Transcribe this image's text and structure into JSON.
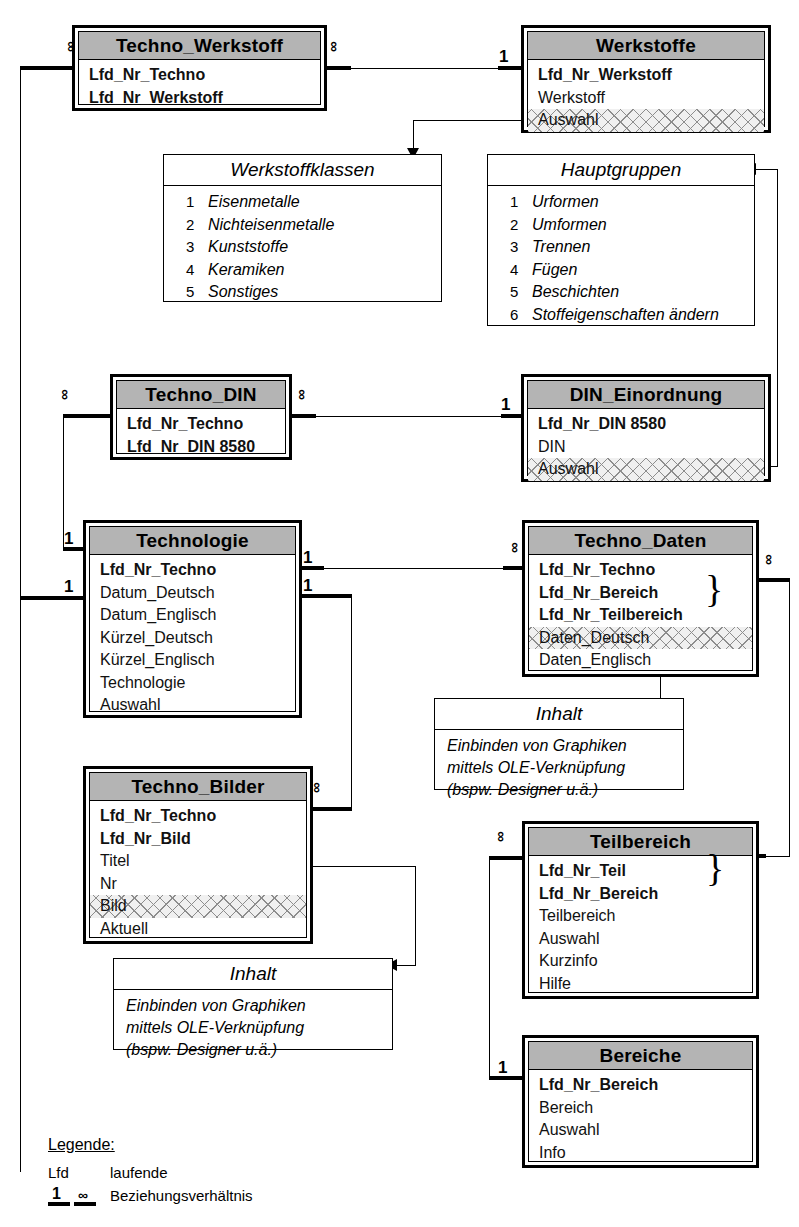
{
  "diagram": {
    "entities": [
      {
        "id": "techno_werkstoff",
        "name": "Techno_Werkstoff",
        "fields": [
          {
            "label": "Lfd_Nr_Techno",
            "key": true,
            "hatched": false
          },
          {
            "label": "Lfd_Nr_Werkstoff",
            "key": true,
            "hatched": false
          }
        ]
      },
      {
        "id": "werkstoffe",
        "name": "Werkstoffe",
        "fields": [
          {
            "label": "Lfd_Nr_Werkstoff",
            "key": true,
            "hatched": false
          },
          {
            "label": "Werkstoff",
            "key": false,
            "hatched": false
          },
          {
            "label": "Auswahl",
            "key": false,
            "hatched": true
          }
        ]
      },
      {
        "id": "techno_din",
        "name": "Techno_DIN",
        "fields": [
          {
            "label": "Lfd_Nr_Techno",
            "key": true,
            "hatched": false
          },
          {
            "label": "Lfd_Nr_DIN 8580",
            "key": true,
            "hatched": false
          }
        ]
      },
      {
        "id": "din_einordnung",
        "name": "DIN_Einordnung",
        "fields": [
          {
            "label": "Lfd_Nr_DIN 8580",
            "key": true,
            "hatched": false
          },
          {
            "label": "DIN",
            "key": false,
            "hatched": false
          },
          {
            "label": "Auswahl",
            "key": false,
            "hatched": true
          }
        ]
      },
      {
        "id": "technologie",
        "name": "Technologie",
        "fields": [
          {
            "label": "Lfd_Nr_Techno",
            "key": true,
            "hatched": false
          },
          {
            "label": "Datum_Deutsch",
            "key": false,
            "hatched": false
          },
          {
            "label": "Datum_Englisch",
            "key": false,
            "hatched": false
          },
          {
            "label": "Kürzel_Deutsch",
            "key": false,
            "hatched": false
          },
          {
            "label": "Kürzel_Englisch",
            "key": false,
            "hatched": false
          },
          {
            "label": "Technologie",
            "key": false,
            "hatched": false
          },
          {
            "label": "Auswahl",
            "key": false,
            "hatched": false
          }
        ]
      },
      {
        "id": "techno_daten",
        "name": "Techno_Daten",
        "fields": [
          {
            "label": "Lfd_Nr_Techno",
            "key": true,
            "hatched": false
          },
          {
            "label": "Lfd_Nr_Bereich",
            "key": true,
            "hatched": false
          },
          {
            "label": "Lfd_Nr_Teilbereich",
            "key": true,
            "hatched": false
          },
          {
            "label": "Daten_Deutsch",
            "key": false,
            "hatched": true
          },
          {
            "label": "Daten_Englisch",
            "key": false,
            "hatched": false
          }
        ]
      },
      {
        "id": "techno_bilder",
        "name": "Techno_Bilder",
        "fields": [
          {
            "label": "Lfd_Nr_Techno",
            "key": true,
            "hatched": false
          },
          {
            "label": "Lfd_Nr_Bild",
            "key": true,
            "hatched": false
          },
          {
            "label": "Titel",
            "key": false,
            "hatched": false
          },
          {
            "label": "Nr",
            "key": false,
            "hatched": false
          },
          {
            "label": "Bild",
            "key": false,
            "hatched": true
          },
          {
            "label": "Aktuell",
            "key": false,
            "hatched": false
          }
        ]
      },
      {
        "id": "teilbereich",
        "name": "Teilbereich",
        "fields": [
          {
            "label": "Lfd_Nr_Teil",
            "key": true,
            "hatched": false
          },
          {
            "label": "Lfd_Nr_Bereich",
            "key": true,
            "hatched": false
          },
          {
            "label": "Teilbereich",
            "key": false,
            "hatched": false
          },
          {
            "label": "Auswahl",
            "key": false,
            "hatched": false
          },
          {
            "label": "Kurzinfo",
            "key": false,
            "hatched": false
          },
          {
            "label": "Hilfe",
            "key": false,
            "hatched": false
          }
        ]
      },
      {
        "id": "bereiche",
        "name": "Bereiche",
        "fields": [
          {
            "label": "Lfd_Nr_Bereich",
            "key": true,
            "hatched": false
          },
          {
            "label": "Bereich",
            "key": false,
            "hatched": false
          },
          {
            "label": "Auswahl",
            "key": false,
            "hatched": false
          },
          {
            "label": "Info",
            "key": false,
            "hatched": false
          }
        ]
      }
    ],
    "lookups": [
      {
        "id": "werkstoffklassen",
        "name": "Werkstoffklassen",
        "rows": [
          {
            "num": "1",
            "label": "Eisenmetalle"
          },
          {
            "num": "2",
            "label": "Nichteisenmetalle"
          },
          {
            "num": "3",
            "label": "Kunststoffe"
          },
          {
            "num": "4",
            "label": "Keramiken"
          },
          {
            "num": "5",
            "label": "Sonstiges"
          }
        ]
      },
      {
        "id": "hauptgruppen",
        "name": "Hauptgruppen",
        "rows": [
          {
            "num": "1",
            "label": "Urformen"
          },
          {
            "num": "2",
            "label": "Umformen"
          },
          {
            "num": "3",
            "label": "Trennen"
          },
          {
            "num": "4",
            "label": "Fügen"
          },
          {
            "num": "5",
            "label": "Beschichten"
          },
          {
            "num": "6",
            "label": "Stoffeigenschaften ändern"
          }
        ]
      }
    ],
    "notes": [
      {
        "id": "inhalt_daten",
        "name": "Inhalt",
        "lines": [
          "Einbinden von Graphiken",
          "mittels OLE-Verknüpfung",
          "(bspw. Designer u.ä.)"
        ]
      },
      {
        "id": "inhalt_bilder",
        "name": "Inhalt",
        "lines": [
          "Einbinden von Graphiken",
          "mittels OLE-Verknüpfung",
          "(bspw. Designer u.ä.)"
        ]
      }
    ],
    "cardinality": {
      "one": "1",
      "many": "∞"
    },
    "braces": {
      "glyph": "}"
    },
    "legend": {
      "title": "Legende:",
      "entries": [
        {
          "key": "Lfd",
          "text": "laufende"
        },
        {
          "key": "1 ∞",
          "text": "Beziehungsverhältnis"
        }
      ],
      "one": "1",
      "many": "∞",
      "lfd_key": "Lfd",
      "lfd_text": "laufende",
      "rel_text": "Beziehungsverhältnis"
    },
    "colors": {
      "line": "#000000",
      "title_bar": "#b4b4b4",
      "hatch": "#8d8d8d",
      "background": "#ffffff"
    }
  }
}
